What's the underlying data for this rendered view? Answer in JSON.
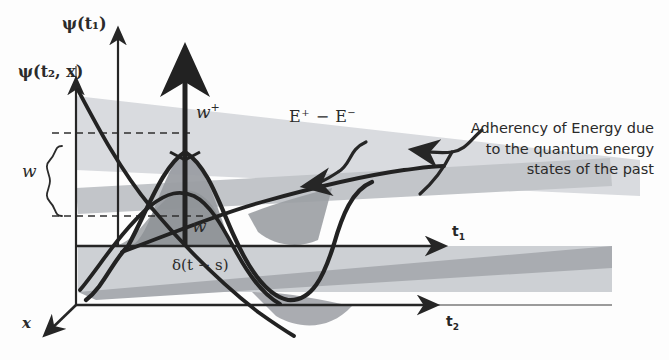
{
  "figure": {
    "kind": "hand-drawn physics diagram",
    "background_color": "#fdfdfd",
    "ink_color": "#262626"
  },
  "axes": [
    {
      "id": "psi-t1",
      "label": "ψ(t₁)",
      "orientation": "vertical",
      "role": "thin vertical axis, left of center"
    },
    {
      "id": "psi-t2x",
      "label": "ψ(t₂, x)",
      "orientation": "vertical",
      "role": "thin vertical axis, far left"
    },
    {
      "id": "t1",
      "label": "t₁",
      "orientation": "horizontal",
      "role": "upper horizontal axis, arrow right"
    },
    {
      "id": "t2",
      "label": "t₂",
      "orientation": "horizontal",
      "role": "lower horizontal axis, arrow right"
    },
    {
      "id": "x",
      "label": "x",
      "orientation": "depth",
      "role": "oblique axis, arrow down-left"
    }
  ],
  "labels": {
    "w_plus": "w",
    "w_plus_sup": "+",
    "w": "w",
    "w_brace": "w",
    "energy_diff": "E",
    "energy_diff_sup1": "+",
    "energy_diff_mid": " − E",
    "energy_diff_sup2": "−",
    "delta": "δ(t − s)"
  },
  "annotation": {
    "text": "Adherency of Energy due\nto the quantum energy\nstates of the past",
    "align": "right",
    "leader": "curved line with arrowheads pointing left into the plot"
  },
  "shading": {
    "light_wedge": "#d8dade",
    "mid_wedge": "#b9bcc0",
    "dark_fill": "#9b9ea3",
    "band_lower": "#a8abaf"
  },
  "curves": [
    {
      "name": "sine-wave",
      "desc": "large oscillating wave crossing the t1 axis, peak near center, trough right of center"
    },
    {
      "name": "hump-curve",
      "desc": "lower bell-shaped hump peaking under w-plus"
    },
    {
      "name": "descending-line",
      "desc": "steep line from psi(t2,x) arrow head down to lower right"
    },
    {
      "name": "ascending-line",
      "desc": "line rising left-to-right from origin region toward t1 arrow"
    }
  ],
  "guides": {
    "dashed_upper": "horizontal dashed line from left axis to the wave peak level",
    "dashed_lower": "horizontal dashed line marking the lower bound of the brace",
    "brace": "left curly brace spanning the w interval"
  }
}
